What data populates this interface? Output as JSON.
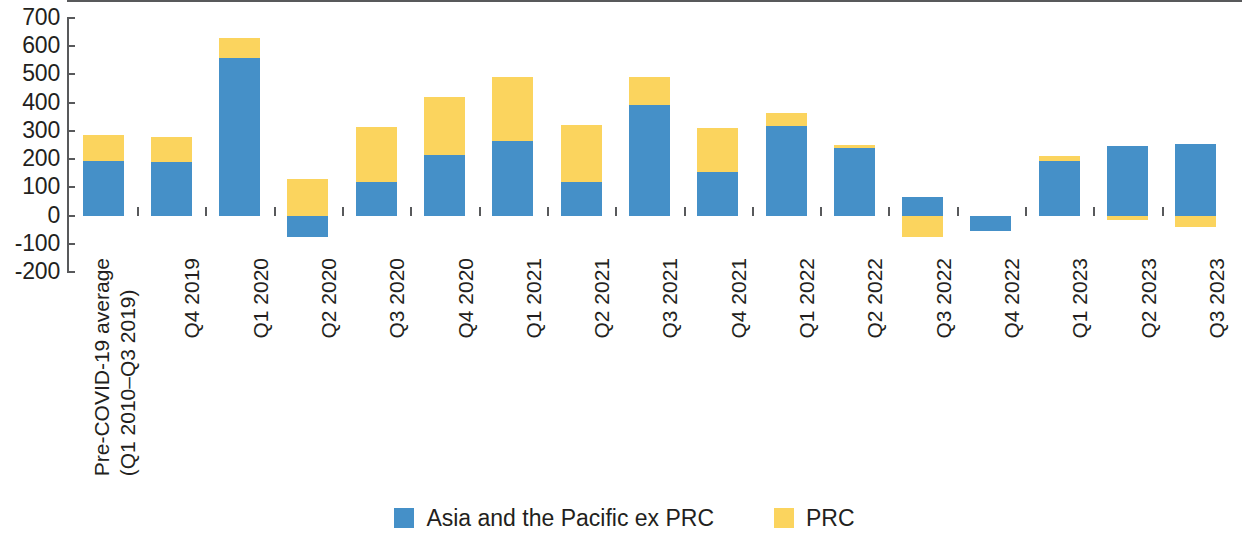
{
  "chart_data": {
    "type": "bar",
    "subtype": "stacked-bar",
    "title": "",
    "subtitle": "",
    "xlabel": "",
    "ylabel": "",
    "ylim": [
      -200,
      700
    ],
    "ytick_step": 100,
    "grid": false,
    "legend_position": "bottom-center",
    "stacked": true,
    "categories": [
      "Pre-COVID-19 average\n(Q1 2010–Q3 2019)",
      "Q4 2019",
      "Q1 2020",
      "Q2 2020",
      "Q3 2020",
      "Q4 2020",
      "Q1 2021",
      "Q2 2021",
      "Q3 2021",
      "Q4 2021",
      "Q1 2022",
      "Q2 2022",
      "Q3 2022",
      "Q4 2022",
      "Q1 2023",
      "Q2 2023",
      "Q3 2023"
    ],
    "ytick_labels": [
      "700",
      "600",
      "500",
      "400",
      "300",
      "200",
      "100",
      "0",
      "-100",
      "-200"
    ],
    "ytick_values": [
      700,
      600,
      500,
      400,
      300,
      200,
      100,
      0,
      -100,
      -200
    ],
    "series": [
      {
        "name": "Asia and the Pacific ex PRC",
        "color": "#4590c8",
        "values": [
          195,
          190,
          560,
          -75,
          120,
          215,
          265,
          118,
          390,
          155,
          318,
          240,
          65,
          -55,
          195,
          245,
          255
        ]
      },
      {
        "name": "PRC",
        "color": "#fbd45e",
        "values": [
          90,
          90,
          70,
          130,
          195,
          205,
          225,
          202,
          100,
          155,
          47,
          10,
          -75,
          0,
          15,
          -15,
          -40
        ]
      }
    ],
    "totals": [
      285,
      280,
      630,
      55,
      315,
      420,
      490,
      320,
      490,
      310,
      365,
      250,
      -10,
      -55,
      210,
      230,
      215
    ]
  },
  "legend": {
    "items": [
      {
        "label": "Asia and the Pacific ex PRC",
        "color": "#4590c8",
        "swatch_name": "legend-swatch-blue"
      },
      {
        "label": "PRC",
        "color": "#fbd45e",
        "swatch_name": "legend-swatch-yellow"
      }
    ]
  },
  "axis": {
    "y": {
      "labels": [
        "700",
        "600",
        "500",
        "400",
        "300",
        "200",
        "100",
        "0",
        "-100",
        "-200"
      ]
    }
  }
}
